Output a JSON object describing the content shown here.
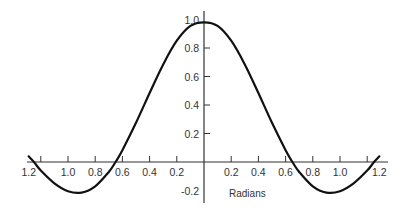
{
  "chart_data": {
    "type": "line",
    "title": "",
    "xlabel": "Radians",
    "ylabel": "",
    "grid": false,
    "legend": null,
    "xlim": [
      -1.3,
      1.3
    ],
    "ylim": [
      -0.25,
      1.0
    ],
    "x_ticks": [
      -1.2,
      -1.0,
      -0.8,
      -0.6,
      -0.4,
      -0.2,
      0.2,
      0.4,
      0.6,
      0.8,
      1.0,
      1.2
    ],
    "x_tick_labels": [
      "1.2",
      "1.0",
      "0.8",
      "0.6",
      "0.4",
      "0.2",
      "0.2",
      "0.4",
      "0.6",
      "0.8",
      "1.0",
      "1.2"
    ],
    "y_ticks": [
      1.0,
      0.8,
      0.6,
      0.4,
      0.2,
      -0.2
    ],
    "y_tick_labels": [
      "1.0",
      "0.8",
      "0.6",
      "0.4",
      "0.2",
      "-0.2"
    ],
    "series": [
      {
        "name": "curve",
        "color": "#111111",
        "x": [
          -1.29,
          -1.25,
          -1.2,
          -1.1,
          -1.0,
          -0.9,
          -0.8,
          -0.7,
          -0.65,
          -0.6,
          -0.5,
          -0.4,
          -0.3,
          -0.2,
          -0.1,
          0.0,
          0.1,
          0.2,
          0.3,
          0.4,
          0.5,
          0.6,
          0.65,
          0.7,
          0.8,
          0.9,
          1.0,
          1.1,
          1.2,
          1.25,
          1.29
        ],
        "values": [
          0.04,
          0.0,
          -0.06,
          -0.15,
          -0.205,
          -0.215,
          -0.171,
          -0.07,
          0.0,
          0.083,
          0.275,
          0.484,
          0.685,
          0.851,
          0.955,
          0.98,
          0.955,
          0.851,
          0.685,
          0.484,
          0.275,
          0.083,
          0.0,
          -0.07,
          -0.171,
          -0.215,
          -0.205,
          -0.15,
          -0.06,
          0.0,
          0.04
        ]
      }
    ]
  },
  "layout": {
    "origin_px": [
      204,
      162
    ],
    "x_px_per_unit": 136,
    "y_px_per_unit": 142.5,
    "x_axis_px": [
      27,
      388
    ],
    "y_axis_px": [
      11,
      203
    ],
    "xlabel_pos": [
      229,
      197
    ]
  }
}
